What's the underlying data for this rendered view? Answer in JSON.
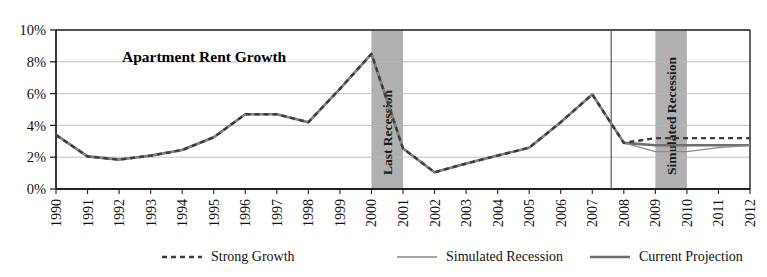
{
  "chart_data": {
    "type": "line",
    "title": "Apartment Rent Growth",
    "xlabel": "",
    "ylabel": "",
    "ylim": [
      0,
      10
    ],
    "ytick_labels": [
      "0%",
      "2%",
      "4%",
      "6%",
      "8%",
      "10%"
    ],
    "ytick_values": [
      0,
      2,
      4,
      6,
      8,
      10
    ],
    "grid": true,
    "legend_position": "bottom",
    "x": [
      1990,
      1991,
      1992,
      1993,
      1994,
      1995,
      1996,
      1997,
      1998,
      1999,
      2000,
      2001,
      2002,
      2003,
      2004,
      2005,
      2006,
      2007,
      2008,
      2009,
      2010,
      2011,
      2012
    ],
    "xtick_labels": [
      "1990",
      "1991",
      "1992",
      "1993",
      "1994",
      "1995",
      "1996",
      "1997",
      "1998",
      "1999",
      "2000",
      "2001",
      "2002",
      "2003",
      "2004",
      "2005",
      "2006",
      "2007",
      "2008",
      "2009",
      "2010",
      "2011",
      "2012"
    ],
    "series": [
      {
        "name": "Current Projection",
        "style": "solid-thick",
        "color": "#6e6e6e",
        "values": [
          3.4,
          2.05,
          1.85,
          2.1,
          2.45,
          3.25,
          4.7,
          4.7,
          4.2,
          6.3,
          8.5,
          2.55,
          1.05,
          1.6,
          2.1,
          2.6,
          4.2,
          5.95,
          2.9,
          2.75,
          2.75,
          2.75,
          2.75
        ]
      },
      {
        "name": "Simulated Recession",
        "style": "solid-thin",
        "color": "#8a8a8a",
        "values": [
          3.4,
          2.05,
          1.85,
          2.1,
          2.45,
          3.25,
          4.7,
          4.7,
          4.2,
          6.3,
          8.5,
          2.55,
          1.05,
          1.6,
          2.1,
          2.6,
          4.2,
          5.95,
          2.9,
          2.35,
          2.35,
          2.6,
          2.75
        ]
      },
      {
        "name": "Strong Growth",
        "style": "dashed",
        "color": "#3c3c3c",
        "values": [
          3.4,
          2.05,
          1.85,
          2.1,
          2.45,
          3.25,
          4.7,
          4.7,
          4.2,
          6.3,
          8.5,
          2.55,
          1.05,
          1.6,
          2.1,
          2.6,
          4.2,
          5.95,
          2.9,
          3.2,
          3.2,
          3.2,
          3.2
        ]
      }
    ],
    "annotations": [
      {
        "label": "Last Recession",
        "x_start": 2000,
        "x_end": 2001,
        "orientation": "vertical"
      },
      {
        "label": "Simulated Recession",
        "x_start": 2009,
        "x_end": 2010,
        "orientation": "vertical"
      }
    ],
    "divider_x": 2007.6,
    "band_color": "#b0b0b0"
  },
  "legend": {
    "items": [
      {
        "label": "Strong Growth",
        "style": "dashed"
      },
      {
        "label": "Simulated Recession",
        "style": "solid-thin"
      },
      {
        "label": "Current Projection",
        "style": "solid-thick"
      }
    ]
  }
}
